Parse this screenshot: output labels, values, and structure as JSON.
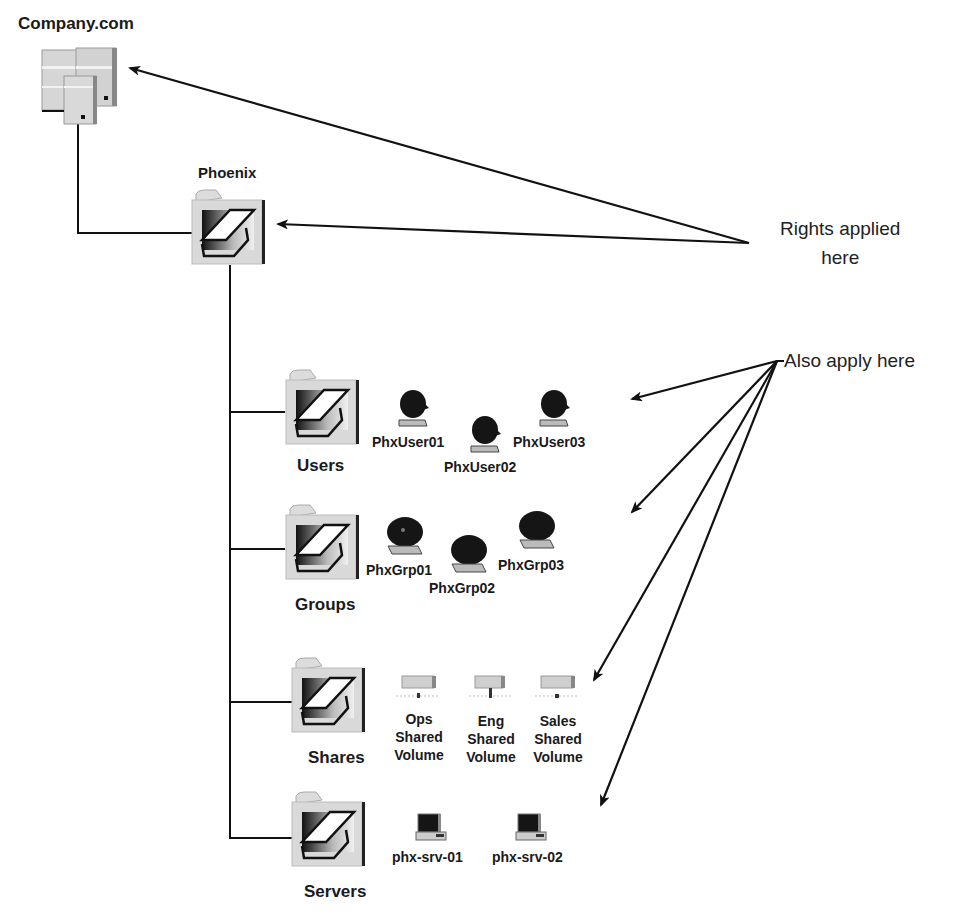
{
  "root": {
    "label": "Company.com",
    "icon": "server-cluster-icon"
  },
  "ou": {
    "label": "Phoenix",
    "icon": "container-folder-icon"
  },
  "notes": {
    "rights_line1": "Rights applied",
    "rights_line2": "here",
    "also_apply": "Also apply here"
  },
  "containers": [
    {
      "label": "Users",
      "icon": "container-folder-icon",
      "items": [
        {
          "label": "PhxUser01",
          "icon": "user-icon"
        },
        {
          "label": "PhxUser02",
          "icon": "user-icon"
        },
        {
          "label": "PhxUser03",
          "icon": "user-icon"
        }
      ]
    },
    {
      "label": "Groups",
      "icon": "container-folder-icon",
      "items": [
        {
          "label": "PhxGrp01",
          "icon": "group-icon"
        },
        {
          "label": "PhxGrp02",
          "icon": "group-icon"
        },
        {
          "label": "PhxGrp03",
          "icon": "group-icon"
        }
      ]
    },
    {
      "label": "Shares",
      "icon": "container-folder-icon",
      "items": [
        {
          "line1": "Ops",
          "line2": "Shared",
          "line3": "Volume",
          "icon": "shared-volume-icon"
        },
        {
          "line1": "Eng",
          "line2": "Shared",
          "line3": "Volume",
          "icon": "shared-volume-icon"
        },
        {
          "line1": "Sales",
          "line2": "Shared",
          "line3": "Volume",
          "icon": "shared-volume-icon"
        }
      ]
    },
    {
      "label": "Servers",
      "icon": "container-folder-icon",
      "items": [
        {
          "label": "phx-srv-01",
          "icon": "computer-icon"
        },
        {
          "label": "phx-srv-02",
          "icon": "computer-icon"
        }
      ]
    }
  ],
  "colors": {
    "line": "#111111",
    "icon_gray": "#d4d4d4",
    "icon_dark": "#151515"
  }
}
